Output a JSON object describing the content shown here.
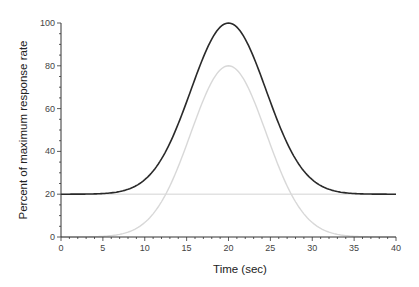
{
  "chart_data": {
    "type": "line",
    "title": "",
    "xlabel": "Time (sec)",
    "ylabel": "Percent of maximum response rate",
    "xlim": [
      0,
      40
    ],
    "ylim": [
      0,
      100
    ],
    "x_ticks": [
      0,
      5,
      10,
      15,
      20,
      25,
      30,
      35,
      40
    ],
    "y_ticks": [
      0,
      20,
      40,
      60,
      80,
      100
    ],
    "grid": false,
    "legend": null,
    "x": [
      0,
      2,
      4,
      6,
      8,
      10,
      12,
      14,
      16,
      18,
      20,
      22,
      24,
      26,
      28,
      30,
      32,
      34,
      36,
      38,
      40
    ],
    "series": [
      {
        "name": "Total response",
        "color": "#2a2a2a",
        "values": [
          20.0,
          20.0,
          20.1,
          20.6,
          22.0,
          26.8,
          35.9,
          54.1,
          77.0,
          93.2,
          100.0,
          93.2,
          77.0,
          54.1,
          35.9,
          26.8,
          22.0,
          20.6,
          20.1,
          20.0,
          20.0
        ]
      },
      {
        "name": "Stimulus-evoked component",
        "color": "#d8d8d8",
        "values": [
          0.0,
          0.0,
          0.1,
          0.6,
          2.0,
          6.8,
          15.9,
          34.1,
          57.0,
          73.2,
          80.0,
          73.2,
          57.0,
          34.1,
          15.9,
          6.8,
          2.0,
          0.6,
          0.1,
          0.0,
          0.0
        ]
      },
      {
        "name": "Baseline",
        "color": "#e2e2e2",
        "values": [
          20,
          20,
          20,
          20,
          20,
          20,
          20,
          20,
          20,
          20,
          20,
          20,
          20,
          20,
          20,
          20,
          20,
          20,
          20,
          20,
          20
        ]
      }
    ],
    "model": {
      "baseline": 20,
      "amplitude": 80,
      "center": 20,
      "sigma": 4.5
    }
  },
  "axes": {
    "x_title": "Time (sec)",
    "y_title": "Percent of maximum response rate"
  }
}
